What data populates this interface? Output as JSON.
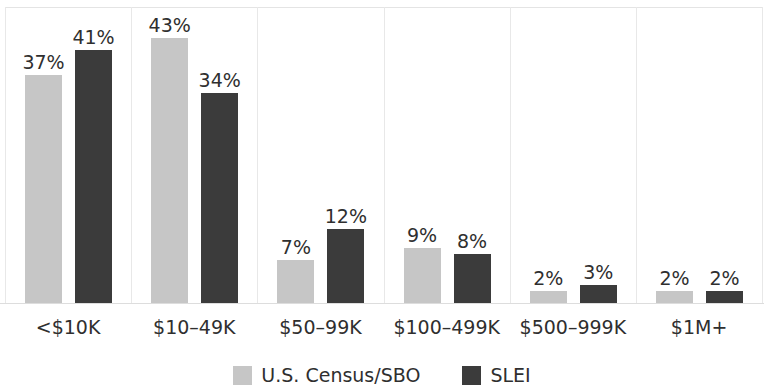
{
  "chart_data": {
    "type": "bar",
    "title": "",
    "subtitle": "",
    "xlabel": "",
    "ylabel": "",
    "ylim": [
      0,
      48
    ],
    "grid": false,
    "legend_position": "bottom",
    "categories": [
      "<$10K",
      "$10–49K",
      "$50–99K",
      "$100–499K",
      "$500–999K",
      "$1M+"
    ],
    "series": [
      {
        "name": "U.S. Census/SBO",
        "color": "#c6c6c6",
        "values": [
          37,
          43,
          7,
          9,
          2,
          2
        ],
        "labels": [
          "37%",
          "43%",
          "7%",
          "9%",
          "2%",
          "2%"
        ]
      },
      {
        "name": "SLEI",
        "color": "#3b3b3b",
        "values": [
          41,
          34,
          12,
          8,
          3,
          2
        ],
        "labels": [
          "41%",
          "34%",
          "12%",
          "8%",
          "3%",
          "2%"
        ]
      }
    ]
  },
  "legend": {
    "items": [
      {
        "label": "U.S. Census/SBO",
        "color": "#c6c6c6",
        "swatch": "legend-swatch-census"
      },
      {
        "label": "SLEI",
        "color": "#3b3b3b",
        "swatch": "legend-swatch-slei"
      }
    ]
  },
  "axis": {
    "x_tick_labels": [
      "<$10K",
      "$10–49K",
      "$50–99K",
      "$100–499K",
      "$500–999K",
      "$1M+"
    ]
  },
  "colors": {
    "series_a": "#c6c6c6",
    "series_b": "#3b3b3b",
    "divider": "#e8e8e8",
    "baseline": "#dddddd",
    "text": "#2f2f2f",
    "background": "#ffffff"
  }
}
